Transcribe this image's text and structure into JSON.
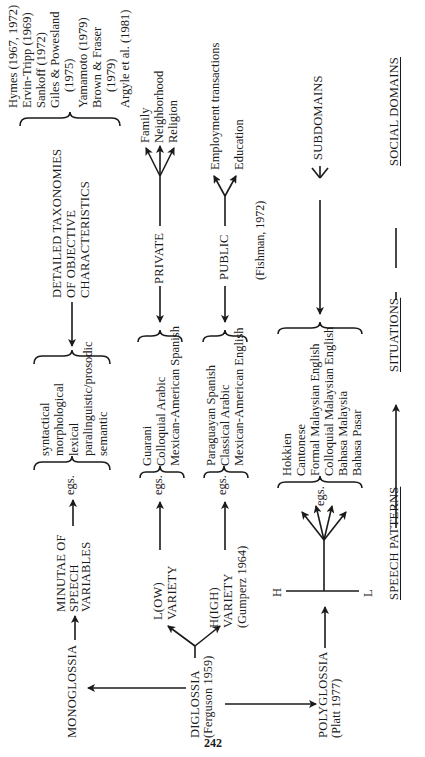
{
  "page_number": "242",
  "levels": {
    "speech_patterns": "SPEECH PATTERNS",
    "situations": "SITUATIONS",
    "social_domains": "SOCIAL DOMAINS"
  },
  "nodes": {
    "monoglossia": "MONOGLOSSIA",
    "diglossia": {
      "label": "DIGLOSSIA",
      "ref": "(Ferguson 1959)"
    },
    "polyglossia": {
      "label": "POLYGLOSSIA",
      "ref": "(Platt 1977)"
    },
    "minutae": [
      "MINUTAE OF",
      "SPEECH",
      "VARIABLES"
    ],
    "low_variety": [
      "L(OW)",
      "VARIETY"
    ],
    "high_variety": [
      "H(IGH)",
      "VARIETY",
      "(Gumperz 1964)"
    ],
    "h_label": "H",
    "l_label": "L",
    "detailed_taxonomies": [
      "DETAILED TAXONOMIES",
      "OF OBJECTIVE",
      "CHARACTERISTICS"
    ],
    "private": "PRIVATE",
    "public": "PUBLIC",
    "fishman_ref": "(Fishman, 1972)",
    "subdomains": "SUBDOMAINS"
  },
  "egs_label": "egs.",
  "examples": {
    "speech_variables": [
      "syntactical",
      "morphological",
      "lexical",
      "paralinguistic/prosodic",
      "semantic"
    ],
    "low_variety": [
      "Guarani",
      "Colloquial Arabic",
      "Mexican-American Spanish"
    ],
    "high_variety": [
      "Paraguayan Spanish",
      "Classical Arabic",
      "Mexican-American English"
    ],
    "polyglossia": [
      "Hokkien",
      "Cantonese",
      "Formal Malaysian English",
      "Colloquial Malaysian English",
      "Bahasa Malaysia",
      "Bahasa Pasar"
    ]
  },
  "private_domains": [
    "Family",
    "Neighborhood",
    "Religion"
  ],
  "public_domains": [
    "Employment transactions",
    "Education"
  ],
  "taxonomy_refs": [
    {
      "text": "Hymes (1967, 1972)",
      "indent": false
    },
    {
      "text": "Ervin-Tripp (1969)",
      "indent": false
    },
    {
      "text": "Sankoff (1972)",
      "indent": false
    },
    {
      "text": "Giles & Powesland",
      "indent": false
    },
    {
      "text": "(1975)",
      "indent": true
    },
    {
      "text": "Yamamoto (1979)",
      "indent": false
    },
    {
      "text": "Brown & Fraser",
      "indent": false
    },
    {
      "text": "(1979)",
      "indent": true
    },
    {
      "text": "Argyle et al. (1981)",
      "indent": false
    }
  ]
}
